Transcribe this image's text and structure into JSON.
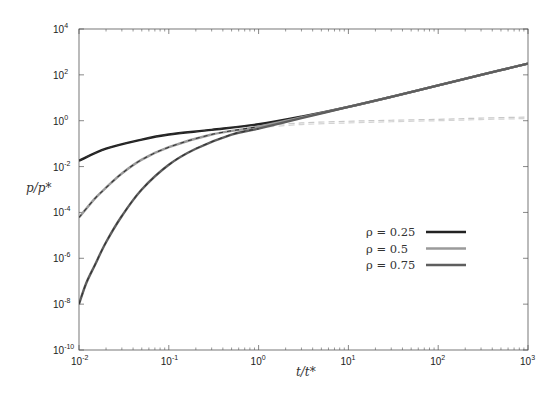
{
  "chart_data": {
    "type": "line",
    "title": "",
    "xlabel": "t/t*",
    "ylabel": "p/p*",
    "xscale": "log",
    "yscale": "log",
    "xlim": [
      0.01,
      1000
    ],
    "ylim": [
      1e-10,
      10000
    ],
    "grid": false,
    "legend_position": "lower right (inside)",
    "x_ticks": [
      {
        "base": "10",
        "exp": "-2",
        "value": 0.01
      },
      {
        "base": "10",
        "exp": "-1",
        "value": 0.1
      },
      {
        "base": "10",
        "exp": "0",
        "value": 1
      },
      {
        "base": "10",
        "exp": "1",
        "value": 10
      },
      {
        "base": "10",
        "exp": "2",
        "value": 100
      },
      {
        "base": "10",
        "exp": "3",
        "value": 1000
      }
    ],
    "y_ticks": [
      {
        "base": "10",
        "exp": "4",
        "value": 10000.0
      },
      {
        "base": "10",
        "exp": "2",
        "value": 100.0
      },
      {
        "base": "10",
        "exp": "0",
        "value": 1
      },
      {
        "base": "10",
        "exp": "-2",
        "value": 0.01
      },
      {
        "base": "10",
        "exp": "-4",
        "value": 0.0001
      },
      {
        "base": "10",
        "exp": "-6",
        "value": 1e-06
      },
      {
        "base": "10",
        "exp": "-8",
        "value": 1e-08
      },
      {
        "base": "10",
        "exp": "-10",
        "value": 1e-10
      }
    ],
    "series": [
      {
        "name": "ρ = 0.25",
        "color": "#222222",
        "style": "solid",
        "x": [
          0.01,
          0.02,
          0.05,
          0.1,
          0.3,
          1,
          3,
          10,
          30,
          100,
          300,
          1000
        ],
        "y": [
          0.018,
          0.06,
          0.15,
          0.25,
          0.4,
          0.7,
          1.5,
          4,
          11,
          35,
          100,
          310
        ]
      },
      {
        "name": "ρ = 0.5",
        "color": "#9a9a9a",
        "style": "solid",
        "x": [
          0.01,
          0.015,
          0.02,
          0.03,
          0.05,
          0.1,
          0.3,
          1,
          3,
          10,
          30,
          100,
          300,
          1000
        ],
        "y": [
          6e-05,
          0.0004,
          0.0012,
          0.005,
          0.02,
          0.07,
          0.25,
          0.55,
          1.4,
          4,
          11,
          35,
          100,
          310
        ]
      },
      {
        "name": "ρ = 0.75",
        "color": "#5e5e5e",
        "style": "solid",
        "x": [
          0.01,
          0.012,
          0.015,
          0.02,
          0.03,
          0.05,
          0.1,
          0.2,
          0.5,
          1,
          3,
          10,
          30,
          100,
          300,
          1000
        ],
        "y": [
          1e-08,
          8e-08,
          5e-07,
          5e-06,
          7e-05,
          0.001,
          0.012,
          0.06,
          0.25,
          0.45,
          1.3,
          4,
          11,
          35,
          100,
          310
        ]
      },
      {
        "name": "ρ = 0.25 (asymptote)",
        "color": "#c8c8c8",
        "style": "dashed",
        "in_legend": false,
        "x": [
          1,
          3,
          10,
          30,
          100,
          300,
          1000
        ],
        "y": [
          0.6,
          0.8,
          0.95,
          1.05,
          1.15,
          1.3,
          1.45
        ]
      },
      {
        "name": "ρ = 0.5 (asymptote)",
        "color": "#d4d4d4",
        "style": "dashed",
        "in_legend": false,
        "x": [
          1,
          3,
          10,
          30,
          100,
          300,
          1000
        ],
        "y": [
          0.5,
          0.68,
          0.8,
          0.9,
          1.0,
          1.12,
          1.25
        ]
      }
    ],
    "overlay_dashes": {
      "description": "dark dashed short-time curves overlaid on each solid series at small t",
      "color": "#333333"
    }
  },
  "legend": {
    "items": [
      {
        "label": "ρ = 0.25",
        "color": "#222222"
      },
      {
        "label": "ρ = 0.5",
        "color": "#9a9a9a"
      },
      {
        "label": "ρ = 0.75",
        "color": "#5e5e5e"
      }
    ]
  },
  "labels": {
    "x_axis": "t/t*",
    "y_axis": "p/p*"
  }
}
